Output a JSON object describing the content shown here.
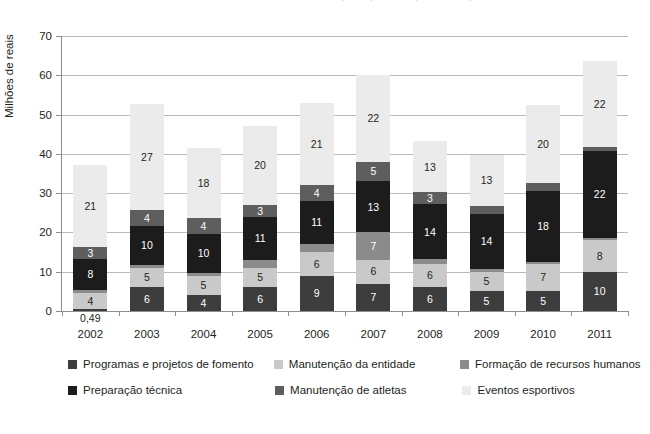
{
  "title_cropped": "Investimentos do Ministério do Esporte por área (2002-2011)",
  "axis": {
    "ylabel": "Milhões de reais",
    "yticks": [
      0,
      10,
      20,
      30,
      40,
      50,
      60,
      70
    ],
    "ymin": 0,
    "ymax": 70
  },
  "legend": {
    "row1": [
      {
        "label": "Programas e projetos de fomento",
        "color": "#3d3d3d"
      },
      {
        "label": "Manutenção da entidade",
        "color": "#c9c9c9"
      },
      {
        "label": "Formação de recursos humanos",
        "color": "#8b8b8b"
      }
    ],
    "row2": [
      {
        "label": "Preparação técnica",
        "color": "#1c1c1c"
      },
      {
        "label": "Manutenção de atletas",
        "color": "#5e5e5e"
      },
      {
        "label": "Eventos esportivos",
        "color": "#ebebeb"
      }
    ]
  },
  "chart_data": {
    "type": "bar",
    "subtype": "stacked",
    "title": "Investimentos do Ministério do Esporte por área (2002-2011)",
    "xlabel": "",
    "ylabel": "Milhões de reais",
    "ylim": [
      0,
      70
    ],
    "yticks": [
      0,
      10,
      20,
      30,
      40,
      50,
      60,
      70
    ],
    "grid": true,
    "legend_position": "bottom",
    "categories": [
      "2002",
      "2003",
      "2004",
      "2005",
      "2006",
      "2007",
      "2008",
      "2009",
      "2010",
      "2011"
    ],
    "series": [
      {
        "name": "Programas e projetos de fomento",
        "color": "#3d3d3d",
        "values": [
          0.49,
          6,
          4,
          6,
          9,
          7,
          6,
          5,
          5,
          10
        ],
        "labels": [
          "0,49",
          "6",
          "4",
          "6",
          "9",
          "7",
          "6",
          "5",
          "5",
          "10"
        ]
      },
      {
        "name": "Manutenção da entidade",
        "color": "#c9c9c9",
        "values": [
          4,
          5,
          5,
          5,
          6,
          6,
          6,
          5,
          7,
          8
        ],
        "labels": [
          "4",
          "5",
          "5",
          "5",
          "6",
          "6",
          "6",
          "5",
          "7",
          "8"
        ]
      },
      {
        "name": "Formação de recursos humanos",
        "color": "#8b8b8b",
        "values": [
          0.75,
          0.68,
          0.59,
          2,
          2,
          7,
          1.18,
          0.81,
          0.52,
          0.64
        ],
        "labels": [
          "0,75",
          "0,68",
          "0,59",
          "2",
          "2",
          "7",
          "1,18",
          "0,81",
          "0,52",
          "0,64"
        ]
      },
      {
        "name": "Preparação técnica",
        "color": "#1c1c1c",
        "values": [
          8,
          10,
          10,
          11,
          11,
          13,
          14,
          14,
          18,
          22
        ],
        "labels": [
          "8",
          "10",
          "10",
          "11",
          "11",
          "13",
          "14",
          "14",
          "18",
          "22"
        ]
      },
      {
        "name": "Manutenção de atletas",
        "color": "#5e5e5e",
        "values": [
          3,
          4,
          4,
          3,
          4,
          5,
          3,
          2,
          2,
          1
        ],
        "labels": [
          "3",
          "4",
          "4",
          "3",
          "4",
          "5",
          "3",
          "2",
          "2",
          ""
        ]
      },
      {
        "name": "Eventos esportivos",
        "color": "#ebebeb",
        "values": [
          21,
          27,
          18,
          20,
          21,
          22,
          13,
          13,
          20,
          22
        ],
        "labels": [
          "21",
          "27",
          "18",
          "20",
          "21",
          "22",
          "13",
          "13",
          "20",
          "22"
        ]
      }
    ],
    "totals": [
      37.24,
      52.68,
      41.59,
      47,
      53,
      60,
      43.18,
      39.81,
      52.52,
      63.64
    ]
  }
}
